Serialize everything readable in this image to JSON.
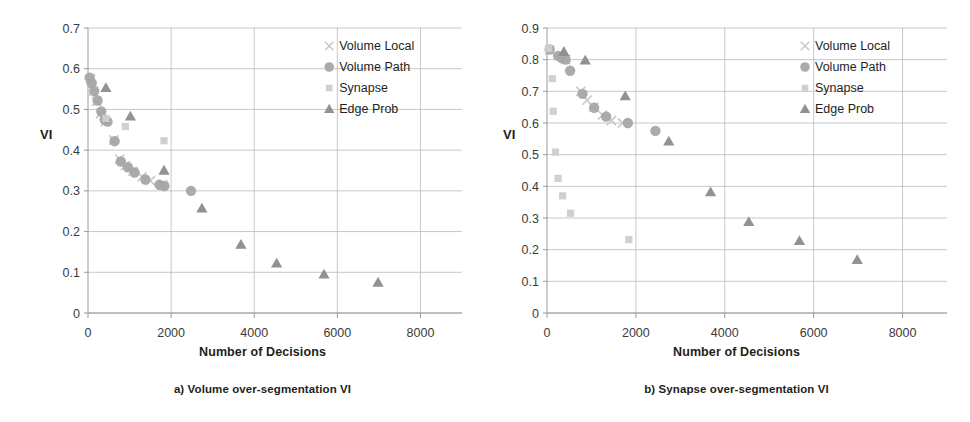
{
  "figure": {
    "panels": [
      {
        "id": "a",
        "caption": "a) Volume over-segmentation VI",
        "ylabel": "VI",
        "xlabel": "Number of Decisions",
        "chart_data": {
          "type": "scatter",
          "title": "a) Volume over-segmentation VI",
          "xlabel": "Number of Decisions",
          "ylabel": "VI",
          "xlim": [
            0,
            9000
          ],
          "ylim": [
            0,
            0.7
          ],
          "xticks": [
            0,
            2000,
            4000,
            6000,
            8000
          ],
          "xticklabels": [
            "0",
            "2000",
            "4000",
            "6000",
            "8000"
          ],
          "yticks": [
            0,
            0.1,
            0.2,
            0.3,
            0.4,
            0.5,
            0.6,
            0.7
          ],
          "yticklabels": [
            "0",
            "0.1",
            "0.2",
            "0.3",
            "0.4",
            "0.5",
            "0.6",
            "0.7"
          ],
          "grid": true,
          "legend_position": "upper right",
          "series": [
            {
              "name": "Volume Local",
              "marker": "x",
              "color": "#c8c8c8",
              "points": [
                [
                  60,
                  0.575
                ],
                [
                  130,
                  0.545
                ],
                [
                  210,
                  0.52
                ],
                [
                  300,
                  0.49
                ],
                [
                  420,
                  0.47
                ],
                [
                  620,
                  0.425
                ],
                [
                  760,
                  0.378
                ],
                [
                  900,
                  0.362
                ],
                [
                  1080,
                  0.348
                ],
                [
                  1300,
                  0.335
                ],
                [
                  1500,
                  0.325
                ],
                [
                  1800,
                  0.315
                ]
              ]
            },
            {
              "name": "Volume Path",
              "marker": "circle",
              "color": "#a6a6a6",
              "points": [
                [
                  40,
                  0.578
                ],
                [
                  90,
                  0.565
                ],
                [
                  150,
                  0.545
                ],
                [
                  230,
                  0.522
                ],
                [
                  320,
                  0.495
                ],
                [
                  400,
                  0.475
                ],
                [
                  470,
                  0.47
                ],
                [
                  640,
                  0.422
                ],
                [
                  790,
                  0.372
                ],
                [
                  960,
                  0.358
                ],
                [
                  1120,
                  0.345
                ],
                [
                  1380,
                  0.328
                ],
                [
                  1720,
                  0.315
                ],
                [
                  1840,
                  0.312
                ],
                [
                  2480,
                  0.3
                ]
              ]
            },
            {
              "name": "Synapse",
              "marker": "square",
              "color": "#cdcdcd",
              "points": [
                [
                  430,
                  0.478
                ],
                [
                  900,
                  0.458
                ],
                [
                  1830,
                  0.423
                ]
              ]
            },
            {
              "name": "Edge Prob",
              "marker": "triangle",
              "color": "#8c8c8c",
              "points": [
                [
                  430,
                  0.553
                ],
                [
                  1020,
                  0.483
                ],
                [
                  1830,
                  0.35
                ],
                [
                  2740,
                  0.257
                ],
                [
                  3680,
                  0.168
                ],
                [
                  4540,
                  0.122
                ],
                [
                  5680,
                  0.095
                ],
                [
                  6980,
                  0.075
                ]
              ]
            }
          ]
        }
      },
      {
        "id": "b",
        "caption": "b) Synapse over-segmentation VI",
        "ylabel": "VI",
        "xlabel": "Number of Decisions",
        "chart_data": {
          "type": "scatter",
          "title": "b) Synapse over-segmentation VI",
          "xlabel": "Number of Decisions",
          "ylabel": "VI",
          "xlim": [
            0,
            9000
          ],
          "ylim": [
            0,
            0.9
          ],
          "xticks": [
            0,
            2000,
            4000,
            6000,
            8000
          ],
          "xticklabels": [
            "0",
            "2000",
            "4000",
            "6000",
            "8000"
          ],
          "yticks": [
            0,
            0.1,
            0.2,
            0.3,
            0.4,
            0.5,
            0.6,
            0.7,
            0.8,
            0.9
          ],
          "yticklabels": [
            "0",
            "0.1",
            "0.2",
            "0.3",
            "0.4",
            "0.5",
            "0.6",
            "0.7",
            "0.8",
            "0.9"
          ],
          "grid": true,
          "legend_position": "upper right",
          "series": [
            {
              "name": "Volume Local",
              "marker": "x",
              "color": "#c8c8c8",
              "points": [
                [
                  60,
                  0.83
                ],
                [
                  420,
                  0.8
                ],
                [
                  760,
                  0.7
                ],
                [
                  900,
                  0.672
                ],
                [
                  1050,
                  0.65
                ],
                [
                  1250,
                  0.625
                ],
                [
                  1450,
                  0.608
                ],
                [
                  1700,
                  0.6
                ]
              ]
            },
            {
              "name": "Volume Path",
              "marker": "circle",
              "color": "#a6a6a6",
              "points": [
                [
                  60,
                  0.832
                ],
                [
                  250,
                  0.812
                ],
                [
                  330,
                  0.805
                ],
                [
                  420,
                  0.8
                ],
                [
                  520,
                  0.765
                ],
                [
                  800,
                  0.692
                ],
                [
                  1060,
                  0.648
                ],
                [
                  1330,
                  0.62
                ],
                [
                  1820,
                  0.6
                ],
                [
                  2440,
                  0.575
                ]
              ]
            },
            {
              "name": "Synapse",
              "marker": "square",
              "color": "#cdcdcd",
              "points": [
                [
                  40,
                  0.835
                ],
                [
                  120,
                  0.74
                ],
                [
                  140,
                  0.637
                ],
                [
                  190,
                  0.508
                ],
                [
                  250,
                  0.425
                ],
                [
                  350,
                  0.37
                ],
                [
                  530,
                  0.315
                ],
                [
                  1840,
                  0.232
                ]
              ]
            },
            {
              "name": "Edge Prob",
              "marker": "triangle",
              "color": "#8c8c8c",
              "points": [
                [
                  380,
                  0.825
                ],
                [
                  860,
                  0.798
                ],
                [
                  1760,
                  0.685
                ],
                [
                  2740,
                  0.542
                ],
                [
                  3680,
                  0.382
                ],
                [
                  4540,
                  0.288
                ],
                [
                  5680,
                  0.228
                ],
                [
                  6980,
                  0.168
                ]
              ]
            }
          ]
        }
      }
    ]
  },
  "legend": {
    "items": [
      {
        "label": "Volume Local",
        "marker": "x"
      },
      {
        "label": "Volume Path",
        "marker": "circle"
      },
      {
        "label": "Synapse",
        "marker": "square"
      },
      {
        "label": "Edge Prob",
        "marker": "triangle"
      }
    ]
  },
  "colors": {
    "volume_local": "#c8c8c8",
    "volume_path": "#a6a6a6",
    "synapse": "#cdcdcd",
    "edge_prob": "#8c8c8c",
    "gridline": "#b9b9b9",
    "axis": "#9a9a9a",
    "text": "#231f20"
  }
}
